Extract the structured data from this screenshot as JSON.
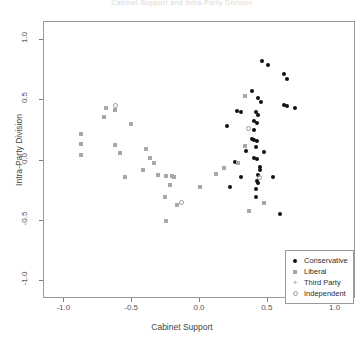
{
  "chart_data": {
    "type": "scatter",
    "title": "Cabinet Support and Intra-Party Division",
    "xlabel": "Cabinet Support",
    "ylabel": "Intra-Party Division",
    "xlim": [
      -1.15,
      1.15
    ],
    "ylim": [
      -1.15,
      1.15
    ],
    "xticks": [
      -1.0,
      -0.5,
      0.0,
      0.5,
      1.0
    ],
    "xtick_labels": [
      "-1.0",
      "-0.5",
      "0.0",
      "0.5",
      "1.0"
    ],
    "yticks": [
      -1.0,
      -0.5,
      0.0,
      0.5,
      1.0
    ],
    "ytick_labels": [
      "-1.0",
      "-0.5",
      "0.0",
      "0.5",
      "1.0"
    ],
    "grid": false,
    "legend_position": "bottom-right",
    "series": [
      {
        "name": "Conservative",
        "marker": "filled-circle",
        "color": "#111111",
        "points": [
          [
            0.46,
            0.83
          ],
          [
            0.5,
            0.79
          ],
          [
            0.62,
            0.72
          ],
          [
            0.64,
            0.68
          ],
          [
            0.38,
            0.58
          ],
          [
            0.43,
            0.52
          ],
          [
            0.45,
            0.49
          ],
          [
            0.62,
            0.46
          ],
          [
            0.64,
            0.45
          ],
          [
            0.7,
            0.44
          ],
          [
            0.27,
            0.41
          ],
          [
            0.3,
            0.4
          ],
          [
            0.41,
            0.4
          ],
          [
            0.43,
            0.38
          ],
          [
            0.4,
            0.33
          ],
          [
            0.42,
            0.31
          ],
          [
            0.2,
            0.29
          ],
          [
            0.4,
            0.25
          ],
          [
            0.38,
            0.18
          ],
          [
            0.4,
            0.17
          ],
          [
            0.42,
            0.16
          ],
          [
            0.41,
            0.11
          ],
          [
            0.34,
            0.08
          ],
          [
            0.47,
            0.07
          ],
          [
            0.4,
            0.02
          ],
          [
            0.42,
            0.01
          ],
          [
            0.26,
            -0.01
          ],
          [
            0.44,
            -0.05
          ],
          [
            0.44,
            -0.08
          ],
          [
            0.43,
            -0.12
          ],
          [
            0.3,
            -0.14
          ],
          [
            0.42,
            -0.17
          ],
          [
            0.43,
            -0.19
          ],
          [
            0.41,
            -0.24
          ],
          [
            0.54,
            -0.14
          ],
          [
            0.22,
            -0.22
          ],
          [
            0.41,
            -0.3
          ],
          [
            0.59,
            -0.44
          ]
        ]
      },
      {
        "name": "Liberal",
        "marker": "filled-square",
        "color": "#a8a8a8",
        "points": [
          [
            -0.69,
            0.44
          ],
          [
            -0.63,
            0.42
          ],
          [
            -0.71,
            0.36
          ],
          [
            -0.51,
            0.3
          ],
          [
            -0.88,
            0.22
          ],
          [
            -0.88,
            0.14
          ],
          [
            -0.88,
            0.05
          ],
          [
            -0.63,
            0.13
          ],
          [
            -0.59,
            0.06
          ],
          [
            -0.4,
            0.1
          ],
          [
            -0.37,
            0.02
          ],
          [
            -0.34,
            -0.02
          ],
          [
            -0.42,
            -0.08
          ],
          [
            -0.31,
            -0.12
          ],
          [
            -0.25,
            -0.13
          ],
          [
            -0.21,
            -0.13
          ],
          [
            -0.19,
            -0.14
          ],
          [
            -0.55,
            -0.14
          ],
          [
            -0.22,
            -0.2
          ],
          [
            -0.26,
            -0.3
          ],
          [
            -0.17,
            -0.37
          ],
          [
            -0.25,
            -0.5
          ],
          [
            0.0,
            -0.22
          ],
          [
            0.12,
            -0.11
          ],
          [
            0.33,
            0.54
          ],
          [
            0.28,
            -0.02
          ],
          [
            0.47,
            -0.35
          ],
          [
            0.36,
            -0.42
          ],
          [
            0.33,
            0.12
          ],
          [
            0.18,
            -0.06
          ]
        ]
      },
      {
        "name": "Third Party",
        "marker": "plus",
        "color": "#8f8f8f",
        "points": []
      },
      {
        "name": "Independent",
        "marker": "open-circle",
        "color": "#999999",
        "points": [
          [
            -0.62,
            0.46
          ],
          [
            -0.14,
            -0.35
          ],
          [
            0.44,
            -0.14
          ],
          [
            0.36,
            0.27
          ]
        ]
      }
    ]
  },
  "legend": {
    "entries": [
      {
        "label": "Conservative",
        "marker": "filled-circle"
      },
      {
        "label": "Liberal",
        "marker": "filled-square"
      },
      {
        "label": "Third Party",
        "marker": "plus"
      },
      {
        "label": "Independent",
        "marker": "open-circle"
      }
    ]
  },
  "symbols": {
    "plus": "+"
  }
}
